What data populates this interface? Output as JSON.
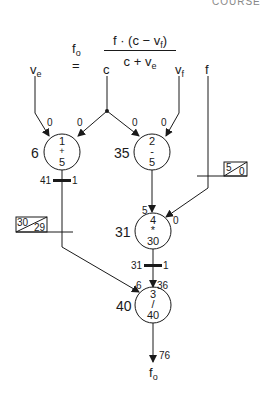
{
  "header_fragment": "COURSE",
  "formula": {
    "lhs": "f",
    "lhs_sub": "o",
    "equals": "=",
    "numerator": "f · (c − v",
    "numerator_sub": "f",
    "numerator_close": ")",
    "denominator": "c + v",
    "denominator_sub": "e"
  },
  "inputs": {
    "ve": {
      "label": "v",
      "sub": "e"
    },
    "c": {
      "label": "c"
    },
    "vf": {
      "label": "v",
      "sub": "f"
    },
    "f": {
      "label": "f"
    }
  },
  "nodes": [
    {
      "id": "node-1",
      "index": "1",
      "op": "+",
      "delay": "5",
      "schedule": "6"
    },
    {
      "id": "node-2",
      "index": "2",
      "op": "-",
      "delay": "5",
      "schedule": "35"
    },
    {
      "id": "node-4",
      "index": "4",
      "op": "*",
      "delay": "30",
      "schedule": "31"
    },
    {
      "id": "node-3",
      "index": "3",
      "op": "/",
      "delay": "40",
      "schedule": "40"
    }
  ],
  "edge_labels": {
    "ve_to_n1": "0",
    "c_to_n1": "0",
    "c_to_n2": "0",
    "vf_to_n2": "0",
    "n2_to_n4": "5",
    "f_to_n4": "0",
    "n4_to_n3": "36",
    "n1_to_n3": "6",
    "output": "76"
  },
  "registers": [
    {
      "id": "reg-n1",
      "left": "41",
      "right": "1"
    },
    {
      "id": "reg-n4",
      "left": "31",
      "right": "1"
    }
  ],
  "boxes": [
    {
      "id": "box-f",
      "top": "5",
      "bottom": "0"
    },
    {
      "id": "box-n1",
      "top": "30",
      "bottom": "29"
    }
  ],
  "output": {
    "label": "f",
    "sub": "o"
  }
}
